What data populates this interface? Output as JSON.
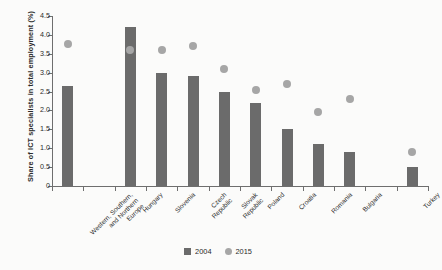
{
  "chart_data": {
    "type": "bar",
    "title": "",
    "subtitle": "",
    "xlabel": "",
    "ylabel": "Share of ICT specialists in total employment (%)",
    "ylim": [
      0,
      4.5
    ],
    "ytick_labels": [
      "0",
      "0.5",
      "1.0",
      "1.5",
      "2.0",
      "2.5",
      "3.0",
      "3.5",
      "4.0",
      "4.5"
    ],
    "ytick_values": [
      0,
      0.5,
      1.0,
      1.5,
      2.0,
      2.5,
      3.0,
      3.5,
      4.0,
      4.5
    ],
    "grid": false,
    "legend_position": "bottom-center",
    "categories": [
      "Western, Southern,\nand Northern\nEurope",
      "",
      "Hungary",
      "Slovenia",
      "Czech\nRepublic",
      "Slovak\nRepublic",
      "Poland",
      "Croatia",
      "Romania",
      "Bulgaria",
      "",
      "Turkey"
    ],
    "series": [
      {
        "name": "2004",
        "type": "bar",
        "color": "#6b6b6b",
        "values": [
          2.65,
          null,
          4.2,
          3.0,
          2.9,
          2.5,
          2.2,
          1.5,
          1.1,
          0.9,
          null,
          0.5
        ]
      },
      {
        "name": "2015",
        "type": "scatter",
        "color": "#a6a6a6",
        "values": [
          3.75,
          null,
          3.6,
          3.6,
          3.7,
          3.1,
          2.55,
          2.7,
          1.95,
          2.3,
          null,
          0.9
        ]
      }
    ]
  },
  "chart": {
    "ylabel": "Share of ICT specialists in total employment (%)",
    "ytick_labels": [
      "4.5",
      "4.0",
      "3.5",
      "3.0",
      "2.5",
      "2.0",
      "1.5",
      "1.0",
      "0.5",
      "0"
    ],
    "xlabels": [
      {
        "lines": [
          "Western, Southern,",
          "and Northern",
          "Europe"
        ]
      },
      {
        "lines": [
          "Hungary"
        ]
      },
      {
        "lines": [
          "Slovenia"
        ]
      },
      {
        "lines": [
          "Czech",
          "Republic"
        ]
      },
      {
        "lines": [
          "Slovak",
          "Republic"
        ]
      },
      {
        "lines": [
          "Poland"
        ]
      },
      {
        "lines": [
          "Croatia"
        ]
      },
      {
        "lines": [
          "Romania"
        ]
      },
      {
        "lines": [
          "Bulgaria"
        ]
      },
      {
        "lines": [
          "Turkey"
        ]
      }
    ],
    "legend": [
      {
        "label": "2004",
        "shape": "square",
        "color": "#6b6b6b"
      },
      {
        "label": "2015",
        "shape": "circle",
        "color": "#a6a6a6"
      }
    ]
  }
}
